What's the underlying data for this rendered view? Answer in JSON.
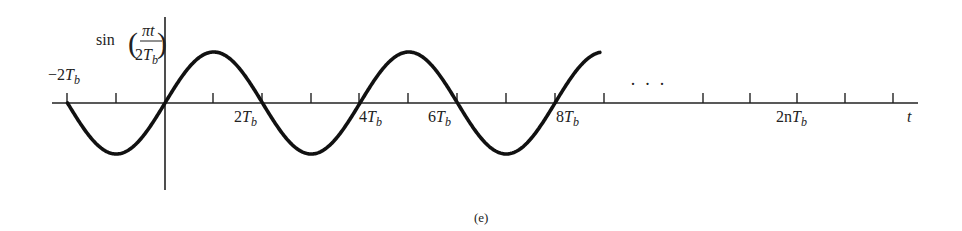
{
  "figure": {
    "caption": "(e)",
    "function_label": {
      "prefix": "sin",
      "numerator": "πt",
      "denominator_coef": "2",
      "denominator_var": "T",
      "denominator_sub": "b"
    },
    "x_axis_var": "t",
    "ellipsis": "· · ·",
    "tick_labels": [
      {
        "id": "neg2Tb",
        "coef": "−2",
        "var": "T",
        "sub": "b"
      },
      {
        "id": "2Tb",
        "coef": "2",
        "var": "T",
        "sub": "b"
      },
      {
        "id": "4Tb",
        "coef": "4",
        "var": "T",
        "sub": "b"
      },
      {
        "id": "6Tb",
        "coef": "6",
        "var": "T",
        "sub": "b"
      },
      {
        "id": "8Tb",
        "coef": "8",
        "var": "T",
        "sub": "b"
      },
      {
        "id": "2nTb",
        "coef": "2n",
        "var": "T",
        "sub": "b"
      }
    ],
    "colors": {
      "ink": "#111111",
      "background": "#ffffff"
    }
  },
  "chart_data": {
    "type": "line",
    "xlabel": "t",
    "ylabel": "sin(πt/2T_b)",
    "x_unit": "T_b",
    "x_range_plotted": [
      -2,
      9
    ],
    "ylim": [
      -1,
      1
    ],
    "grid": false,
    "x_tick_positions_Tb": [
      -2,
      -1,
      1,
      2,
      3,
      4,
      5,
      6,
      7,
      8,
      9,
      11,
      12,
      13,
      14,
      15
    ],
    "labeled_ticks": [
      "-2T_b",
      "2T_b",
      "4T_b",
      "6T_b",
      "8T_b",
      "2nT_b"
    ],
    "zero_crossings_Tb": [
      -2,
      0,
      2,
      4,
      6,
      8
    ],
    "peaks_Tb": [
      1,
      5
    ],
    "troughs_Tb": [
      -1,
      3,
      7
    ],
    "annotations": [
      "· · ·",
      "(e)"
    ]
  }
}
